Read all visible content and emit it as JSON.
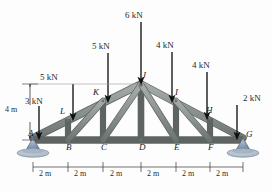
{
  "figure": {
    "background_color": "#fdfdfd",
    "member_color": "#8d9492",
    "member_edge_color": "#5d6462",
    "support_color": "#7f94ad",
    "arrow_color": "#111111",
    "label_color": "#2b2b2b"
  },
  "loads": [
    {
      "id": "load-A",
      "label": "3 kN",
      "node": "A",
      "magnitude": 3,
      "unit": "kN",
      "direction": "down"
    },
    {
      "id": "load-L",
      "label": "5 kN",
      "node": "L",
      "magnitude": 5,
      "unit": "kN",
      "direction": "down"
    },
    {
      "id": "load-K",
      "label": "5 kN",
      "node": "K",
      "magnitude": 5,
      "unit": "kN",
      "direction": "down"
    },
    {
      "id": "load-J",
      "label": "6 kN",
      "node": "J",
      "magnitude": 6,
      "unit": "kN",
      "direction": "down"
    },
    {
      "id": "load-I",
      "label": "4 kN",
      "node": "I",
      "magnitude": 4,
      "unit": "kN",
      "direction": "down"
    },
    {
      "id": "load-H",
      "label": "4 kN",
      "node": "H",
      "magnitude": 4,
      "unit": "kN",
      "direction": "down"
    },
    {
      "id": "load-G",
      "label": "2 kN",
      "node": "G",
      "magnitude": 2,
      "unit": "kN",
      "direction": "down"
    }
  ],
  "nodes": [
    {
      "id": "A",
      "label": "A"
    },
    {
      "id": "B",
      "label": "B"
    },
    {
      "id": "C",
      "label": "C"
    },
    {
      "id": "D",
      "label": "D"
    },
    {
      "id": "E",
      "label": "E"
    },
    {
      "id": "F",
      "label": "F"
    },
    {
      "id": "G",
      "label": "G"
    },
    {
      "id": "H",
      "label": "H"
    },
    {
      "id": "I",
      "label": "I"
    },
    {
      "id": "J",
      "label": "J"
    },
    {
      "id": "K",
      "label": "K"
    },
    {
      "id": "L",
      "label": "L"
    }
  ],
  "dimensions": {
    "height_label": "4 m",
    "span_segments": [
      "2 m",
      "2 m",
      "2 m",
      "2 m",
      "2 m",
      "2 m"
    ]
  },
  "supports": [
    {
      "id": "support-A",
      "node": "A",
      "type": "pin"
    },
    {
      "id": "support-G",
      "node": "G",
      "type": "pin"
    }
  ]
}
